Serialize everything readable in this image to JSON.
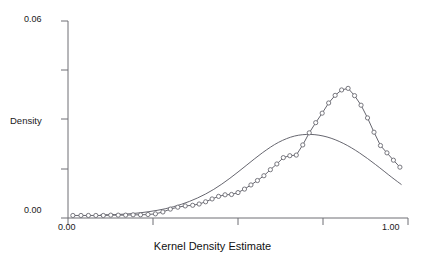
{
  "chart_data": {
    "type": "line",
    "title": "",
    "xlabel": "Kernel Density Estimate",
    "ylabel": "Density",
    "xlim": [
      0.0,
      1.05
    ],
    "ylim": [
      0.0,
      0.062
    ],
    "grid": false,
    "legend": null,
    "xticks": [
      0.0,
      0.25,
      0.5,
      0.75,
      1.0
    ],
    "xticklabels": [
      "0.00",
      "",
      "",
      "",
      "1.00"
    ],
    "yticks": [
      0.0,
      0.015,
      0.03,
      0.045,
      0.06
    ],
    "yticklabels": [
      "0.00",
      "",
      "",
      "",
      "0.06"
    ],
    "line_color": "#55555f",
    "marker_color": "#6a6a72",
    "series": [
      {
        "name": "empirical-kde",
        "style": "line-with-circle-markers",
        "x": [
          0.015,
          0.04,
          0.063,
          0.086,
          0.109,
          0.132,
          0.155,
          0.178,
          0.201,
          0.224,
          0.247,
          0.27,
          0.293,
          0.316,
          0.339,
          0.362,
          0.385,
          0.405,
          0.425,
          0.445,
          0.465,
          0.485,
          0.505,
          0.525,
          0.545,
          0.565,
          0.585,
          0.605,
          0.625,
          0.645,
          0.665,
          0.685,
          0.705,
          0.725,
          0.745,
          0.765,
          0.785,
          0.805,
          0.825,
          0.845,
          0.865,
          0.885,
          0.905,
          0.925,
          0.945,
          0.965,
          0.985,
          1.005,
          1.025
        ],
        "y": [
          0.0008,
          0.0008,
          0.0008,
          0.0008,
          0.0008,
          0.0009,
          0.0009,
          0.0009,
          0.001,
          0.001,
          0.0011,
          0.0013,
          0.0019,
          0.0028,
          0.0034,
          0.0038,
          0.004,
          0.0044,
          0.0051,
          0.006,
          0.0068,
          0.0073,
          0.0074,
          0.008,
          0.0091,
          0.0104,
          0.0118,
          0.0133,
          0.0152,
          0.017,
          0.019,
          0.0196,
          0.0198,
          0.023,
          0.0268,
          0.03,
          0.033,
          0.0362,
          0.0386,
          0.0403,
          0.0408,
          0.0385,
          0.0355,
          0.0315,
          0.027,
          0.0228,
          0.0205,
          0.0182,
          0.016
        ]
      },
      {
        "name": "smooth-kde",
        "style": "line",
        "x": [
          0.1,
          0.15,
          0.2,
          0.25,
          0.3,
          0.35,
          0.4,
          0.45,
          0.5,
          0.55,
          0.6,
          0.65,
          0.7,
          0.75,
          0.8,
          0.85,
          0.9,
          0.95,
          1.0,
          1.03
        ],
        "y": [
          0.001,
          0.0011,
          0.0014,
          0.002,
          0.0029,
          0.0043,
          0.0063,
          0.009,
          0.0125,
          0.0165,
          0.0205,
          0.0238,
          0.0258,
          0.0263,
          0.0255,
          0.0235,
          0.0205,
          0.0168,
          0.0128,
          0.0105
        ]
      }
    ]
  },
  "axis": {
    "y_label": "Density",
    "y_tick_top": "0.06",
    "y_tick_bottom": "0.00",
    "x_tick_left": "0.00",
    "x_tick_right": "1.00",
    "x_title": "Kernel Density Estimate"
  }
}
